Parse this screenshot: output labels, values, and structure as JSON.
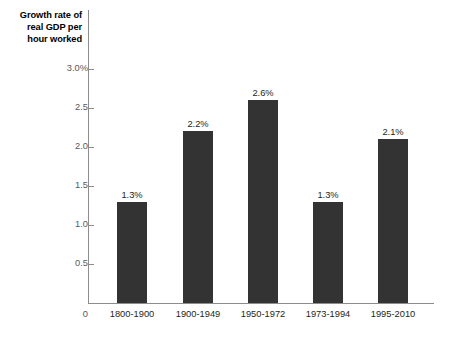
{
  "chart_data": {
    "type": "bar",
    "title": "",
    "ylabel": "Growth rate of real GDP per hour worked",
    "xlabel": "",
    "categories": [
      "1800-1900",
      "1900-1949",
      "1950-1972",
      "1973-1994",
      "1995-2010"
    ],
    "values": [
      1.3,
      2.2,
      2.6,
      1.3,
      2.1
    ],
    "value_labels": [
      "1.3%",
      "2.2%",
      "2.6%",
      "1.3%",
      "2.1%"
    ],
    "ylim": [
      0,
      3.0
    ],
    "ytick_values": [
      3.0,
      2.5,
      2.0,
      1.5,
      1.0,
      0.5,
      0
    ],
    "ytick_labels": [
      "3.0%",
      "2.5",
      "2.0",
      "1.5",
      "1.0",
      "0.5",
      "0"
    ],
    "grid": false,
    "legend": null,
    "bar_color": "#333333",
    "axis_color": "#8d8d8d",
    "text_color": "#231f20",
    "tick_text_color": "#58595b",
    "background": "#ffffff"
  },
  "axis_title": {
    "line1": "Growth rate of",
    "line2": "real GDP per",
    "line3": "hour worked"
  }
}
